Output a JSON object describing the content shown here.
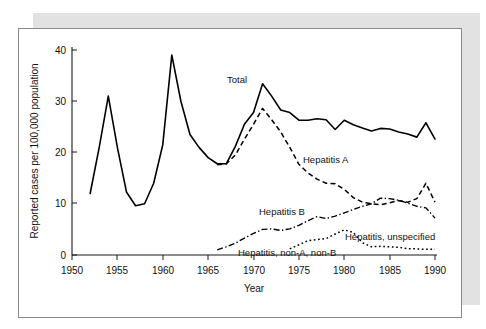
{
  "figure": {
    "frame_border_color": "#8a8a8a",
    "shadow_color": "#e2e2e2",
    "background_color": "#ffffff"
  },
  "chart_data": {
    "type": "line",
    "title": "",
    "xlabel": "Year",
    "ylabel": "Reported cases per 100,000 population",
    "xlim": [
      1950,
      1990
    ],
    "ylim": [
      0,
      40
    ],
    "xticks": [
      1950,
      1955,
      1960,
      1965,
      1970,
      1975,
      1980,
      1985,
      1990
    ],
    "yticks": [
      0,
      10,
      20,
      30,
      40
    ],
    "xtick_labels": [
      "1950",
      "1955",
      "1960",
      "1965",
      "1970",
      "1975",
      "1980",
      "1985",
      "1990"
    ],
    "ytick_labels": [
      "0",
      "10",
      "20",
      "30",
      "40"
    ],
    "grid": false,
    "legend_position": "inline-annotations",
    "line_color": "#000000",
    "series": [
      {
        "name": "Total",
        "label": "Total",
        "style": "solid",
        "x": [
          1952,
          1953,
          1954,
          1955,
          1956,
          1957,
          1958,
          1959,
          1960,
          1961,
          1962,
          1963,
          1964,
          1965,
          1966,
          1967,
          1968,
          1969,
          1970,
          1971,
          1972,
          1973,
          1974,
          1975,
          1976,
          1977,
          1978,
          1979,
          1980,
          1981,
          1982,
          1983,
          1984,
          1985,
          1986,
          1987,
          1988,
          1989,
          1990
        ],
        "values": [
          12.0,
          21.0,
          31.0,
          21.0,
          12.3,
          9.6,
          10.0,
          14.0,
          21.5,
          39.0,
          30.0,
          23.5,
          21.0,
          19.0,
          17.8,
          17.8,
          21.2,
          25.5,
          27.8,
          33.4,
          31.0,
          28.3,
          27.8,
          26.3,
          26.3,
          26.6,
          26.4,
          24.5,
          26.3,
          25.4,
          24.8,
          24.2,
          24.7,
          24.6,
          24.0,
          23.6,
          23.0,
          25.8,
          22.6
        ]
      },
      {
        "name": "Hepatitis A",
        "label": "Hepatitis A",
        "style": "dashed",
        "x": [
          1966,
          1967,
          1968,
          1969,
          1970,
          1971,
          1972,
          1973,
          1974,
          1975,
          1976,
          1977,
          1978,
          1979,
          1980,
          1981,
          1982,
          1983,
          1984,
          1985,
          1986,
          1987,
          1988,
          1989,
          1990
        ],
        "values": [
          17.6,
          17.8,
          19.5,
          22.6,
          25.5,
          28.6,
          26.4,
          24.0,
          21.0,
          17.7,
          16.0,
          14.8,
          14.0,
          13.9,
          12.8,
          11.2,
          10.3,
          10.0,
          9.8,
          10.2,
          10.6,
          10.3,
          11.0,
          14.0,
          10.3
        ]
      },
      {
        "name": "Hepatitis B",
        "label": "Hepatitis B",
        "style": "dash-dot",
        "x": [
          1966,
          1967,
          1968,
          1969,
          1970,
          1971,
          1972,
          1973,
          1974,
          1975,
          1976,
          1977,
          1978,
          1979,
          1980,
          1981,
          1982,
          1983,
          1984,
          1985,
          1986,
          1987,
          1988,
          1989,
          1990
        ],
        "values": [
          1.0,
          1.6,
          2.3,
          3.3,
          4.2,
          5.0,
          5.1,
          4.8,
          5.1,
          5.8,
          6.7,
          7.5,
          7.1,
          7.6,
          8.2,
          8.9,
          9.5,
          10.0,
          11.1,
          11.0,
          10.7,
          10.1,
          9.5,
          9.2,
          7.2
        ]
      },
      {
        "name": "Hepatitis, non-A, non-B",
        "label": "Hepatitis, non-A, non-B",
        "style": "dotted",
        "x": [
          1974,
          1975,
          1976,
          1977,
          1978,
          1979,
          1980,
          1981,
          1982,
          1983,
          1984,
          1985,
          1986,
          1987,
          1988,
          1989,
          1990
        ],
        "values": [
          1.2,
          2.0,
          2.8,
          3.0,
          3.2,
          4.1,
          4.9,
          4.4,
          2.4,
          1.6,
          1.7,
          1.6,
          1.5,
          1.2,
          1.2,
          1.1,
          1.1
        ]
      }
    ],
    "annotations": [
      {
        "text": "Total",
        "x": 1969.0,
        "y": 36.2
      },
      {
        "text": "Hepatitis A",
        "x": 1975.0,
        "y": 19.0
      },
      {
        "text": "Hepatitis B",
        "x": 1971.5,
        "y": 10.6
      },
      {
        "text": "Hepatitis, unspecified",
        "x": 1981.4,
        "y": 6.4
      },
      {
        "text": "Hepatitis, non-A, non-B",
        "x": 1970.8,
        "y": 2.9
      }
    ]
  }
}
